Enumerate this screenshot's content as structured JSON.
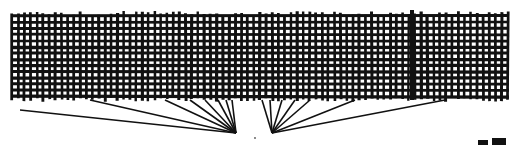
{
  "illustration": {
    "description": "Black ink drawing of a woven mesh grid band with radiating lines converging toward a point below",
    "colors": {
      "background": "#ffffff",
      "ink": "#111111"
    },
    "mesh": {
      "x": 12,
      "y": 14,
      "width": 496,
      "height": 86,
      "cell": 6.2,
      "dark_band_x": 412
    },
    "rays": {
      "left_focus": [
        236,
        133
      ],
      "right_focus": [
        272,
        133
      ],
      "center_dot": [
        255,
        138
      ],
      "left_ends": [
        [
          20,
          110
        ],
        [
          90,
          100
        ],
        [
          165,
          100
        ],
        [
          190,
          100
        ],
        [
          205,
          100
        ],
        [
          218,
          100
        ],
        [
          226,
          100
        ],
        [
          232,
          100
        ]
      ],
      "right_ends": [
        [
          262,
          100
        ],
        [
          270,
          100
        ],
        [
          282,
          100
        ],
        [
          295,
          100
        ],
        [
          310,
          100
        ],
        [
          355,
          100
        ],
        [
          445,
          100
        ]
      ]
    },
    "bottom_marks": [
      [
        478,
        140,
        10,
        5
      ],
      [
        492,
        138,
        14,
        7
      ]
    ]
  }
}
